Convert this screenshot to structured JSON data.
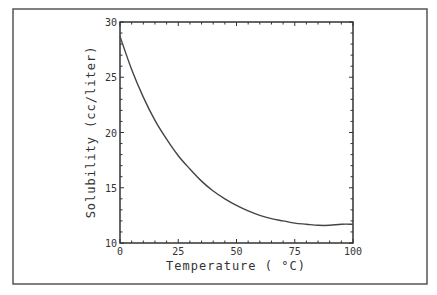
{
  "chart_data": {
    "type": "line",
    "title": "",
    "xlabel": "Temperature (°C)",
    "ylabel": "Solubility (cc/liter)",
    "xlim": [
      0,
      100
    ],
    "ylim": [
      10,
      30
    ],
    "xticks": [
      0,
      25,
      50,
      75,
      100
    ],
    "xtick_labels": [
      "0",
      "25",
      "50",
      "75",
      "100"
    ],
    "yticks": [
      10,
      15,
      20,
      25,
      30
    ],
    "ytick_labels": [
      "10",
      "15",
      "20",
      "25",
      "30"
    ],
    "grid": false,
    "legend": null,
    "series": [
      {
        "name": "Solubility",
        "x": [
          0,
          5,
          10,
          15,
          20,
          25,
          30,
          35,
          40,
          45,
          50,
          55,
          60,
          65,
          70,
          75,
          80,
          85,
          90,
          95,
          100
        ],
        "y": [
          28.7,
          25.7,
          23.2,
          21.1,
          19.4,
          17.9,
          16.7,
          15.6,
          14.7,
          14.0,
          13.4,
          12.9,
          12.5,
          12.2,
          12.0,
          11.8,
          11.7,
          11.6,
          11.6,
          11.7,
          11.7
        ]
      }
    ]
  },
  "labels": {
    "xlabel": "Temperature ( °C)",
    "ylabel": "Solubility (cc/liter)"
  },
  "colors": {
    "line": "#444444",
    "axes": "#333333",
    "frame": "#555555"
  }
}
